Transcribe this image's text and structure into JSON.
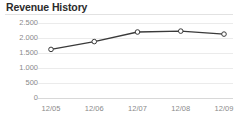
{
  "widget": {
    "title": "Revenue History",
    "background_color": "#ffffff",
    "rule_color": "#e2e2e2"
  },
  "chart_data": {
    "type": "line",
    "title": "Revenue History",
    "xlabel": "",
    "ylabel": "",
    "categories": [
      "12/05",
      "12/06",
      "12/07",
      "12/08",
      "12/09"
    ],
    "values": [
      1620,
      1880,
      2200,
      2230,
      2130
    ],
    "series": [
      {
        "name": "Revenue",
        "values": [
          1620,
          1880,
          2200,
          2230,
          2130
        ],
        "line_color": "#3a3a3a",
        "marker_fill": "#ffffff",
        "marker_stroke": "#3a3a3a"
      }
    ],
    "ylim": [
      0,
      2500
    ],
    "ytick_values": [
      0,
      500,
      1000,
      1500,
      2000,
      2500
    ],
    "ytick_labels": [
      "0",
      "500",
      "1.000",
      "1.500",
      "2.000",
      "2.500"
    ],
    "xtick_labels": [
      "12/05",
      "12/06",
      "12/07",
      "12/08",
      "12/09"
    ],
    "grid": true,
    "grid_color": "#ebebeb",
    "axis_color": "#d8d8d8",
    "tick_label_color": "#8a8a8a",
    "legend": false,
    "legend_position": "none"
  }
}
